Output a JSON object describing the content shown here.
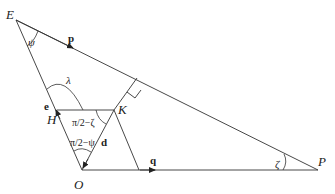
{
  "figure": {
    "points": {
      "E": {
        "label": "E"
      },
      "P": {
        "label": "P"
      },
      "O": {
        "label": "O"
      },
      "H": {
        "label": "H"
      },
      "K": {
        "label": "K"
      }
    },
    "vectors": {
      "p": "p",
      "q": "q",
      "d": "d",
      "e": "e"
    },
    "angles": {
      "psi": "ψ",
      "lambda": "λ",
      "zeta": "ζ",
      "half_pi_minus_zeta": "π/2−ζ",
      "half_pi_minus_psi": "π/2−ψ"
    },
    "colors": {
      "stroke": "#333333",
      "text": "#222222"
    }
  }
}
